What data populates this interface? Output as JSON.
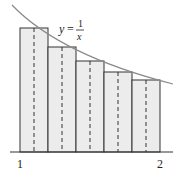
{
  "diagram": {
    "function_label": {
      "y": "y",
      "eq": "=",
      "num": "1",
      "den": "x"
    },
    "x_ticks": [
      {
        "label": "1",
        "value": 1
      },
      {
        "label": "2",
        "value": 2
      }
    ],
    "rectangles": [
      {
        "x_left": 1.0,
        "x_right": 1.2,
        "midpoint": 1.1,
        "height": 0.909
      },
      {
        "x_left": 1.2,
        "x_right": 1.4,
        "midpoint": 1.3,
        "height": 0.769
      },
      {
        "x_left": 1.4,
        "x_right": 1.6,
        "midpoint": 1.5,
        "height": 0.667
      },
      {
        "x_left": 1.6,
        "x_right": 1.8,
        "midpoint": 1.7,
        "height": 0.588
      },
      {
        "x_left": 1.8,
        "x_right": 2.0,
        "midpoint": 1.9,
        "height": 0.526
      }
    ],
    "colors": {
      "rect_fill": "#ececec",
      "rect_stroke": "#333333",
      "curve": "#8a8a8a",
      "axis": "#333333"
    }
  }
}
